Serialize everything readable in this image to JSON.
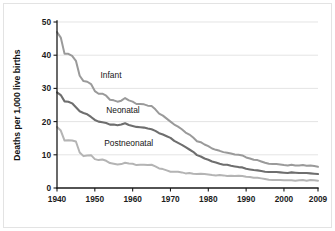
{
  "chart_data": {
    "type": "line",
    "title": "",
    "xlabel": "",
    "ylabel": "Deaths per 1,000 live births",
    "xlim": [
      1940,
      2009
    ],
    "ylim": [
      0,
      50
    ],
    "grid": true,
    "legend_position": "inline-labels",
    "xticks": [
      1940,
      1950,
      1960,
      1970,
      1980,
      1990,
      2000,
      2009
    ],
    "xtick_labels": [
      "1940",
      "1950",
      "1960",
      "1970",
      "1980",
      "1990",
      "2000",
      "2009"
    ],
    "yticks": [
      0,
      10,
      20,
      30,
      40,
      50
    ],
    "ytick_labels": [
      "0",
      "10",
      "20",
      "30",
      "40",
      "50"
    ],
    "x": [
      1940,
      1941,
      1942,
      1943,
      1944,
      1945,
      1946,
      1947,
      1948,
      1949,
      1950,
      1951,
      1952,
      1953,
      1954,
      1955,
      1956,
      1957,
      1958,
      1959,
      1960,
      1961,
      1962,
      1963,
      1964,
      1965,
      1966,
      1967,
      1968,
      1969,
      1970,
      1971,
      1972,
      1973,
      1974,
      1975,
      1976,
      1977,
      1978,
      1979,
      1980,
      1981,
      1982,
      1983,
      1984,
      1985,
      1986,
      1987,
      1988,
      1989,
      1990,
      1991,
      1992,
      1993,
      1994,
      1995,
      1996,
      1997,
      1998,
      1999,
      2000,
      2001,
      2002,
      2003,
      2004,
      2005,
      2006,
      2007,
      2008,
      2009
    ],
    "series": [
      {
        "name": "Infant",
        "color": "#9a9a9a",
        "label_x": 1951.5,
        "label_y": 33.2,
        "values": [
          47.0,
          45.3,
          40.4,
          40.4,
          39.8,
          38.3,
          33.8,
          32.2,
          32.0,
          31.3,
          29.2,
          28.4,
          28.4,
          27.8,
          26.6,
          26.4,
          26.0,
          26.3,
          27.1,
          26.4,
          26.0,
          25.3,
          25.3,
          25.2,
          24.8,
          24.7,
          23.7,
          22.4,
          21.8,
          20.9,
          20.0,
          19.1,
          18.5,
          17.7,
          16.7,
          16.1,
          15.2,
          14.1,
          13.8,
          13.1,
          12.6,
          11.9,
          11.5,
          11.2,
          10.8,
          10.6,
          10.4,
          10.1,
          10.0,
          9.8,
          9.2,
          8.9,
          8.5,
          8.4,
          8.0,
          7.6,
          7.3,
          7.2,
          7.2,
          7.1,
          6.9,
          6.8,
          7.0,
          6.8,
          6.8,
          6.9,
          6.7,
          6.8,
          6.6,
          6.4
        ]
      },
      {
        "name": "Neonatal",
        "color": "#6e6e6e",
        "label_x": 1953.0,
        "label_y": 22.6,
        "values": [
          28.8,
          28.0,
          26.1,
          26.0,
          25.5,
          24.3,
          23.1,
          22.6,
          22.2,
          21.4,
          20.5,
          20.0,
          19.8,
          19.6,
          19.1,
          19.1,
          18.9,
          19.1,
          19.5,
          19.0,
          18.7,
          18.4,
          18.3,
          18.2,
          17.9,
          17.7,
          17.2,
          16.5,
          16.1,
          15.6,
          15.1,
          14.2,
          13.6,
          13.0,
          12.3,
          11.6,
          10.9,
          9.9,
          9.5,
          8.9,
          8.5,
          8.0,
          7.7,
          7.3,
          7.0,
          7.0,
          6.7,
          6.5,
          6.3,
          6.2,
          5.8,
          5.6,
          5.4,
          5.3,
          5.1,
          4.9,
          4.8,
          4.8,
          4.8,
          4.7,
          4.6,
          4.5,
          4.7,
          4.6,
          4.5,
          4.5,
          4.5,
          4.4,
          4.3,
          4.2
        ]
      },
      {
        "name": "Postneonatal",
        "color": "#b4b4b4",
        "label_x": 1952.5,
        "label_y": 12.6,
        "values": [
          18.4,
          17.3,
          14.3,
          14.4,
          14.3,
          14.0,
          10.7,
          9.6,
          9.8,
          9.9,
          8.7,
          8.4,
          8.6,
          8.2,
          7.5,
          7.3,
          7.1,
          7.2,
          7.6,
          7.4,
          7.3,
          6.9,
          7.0,
          7.0,
          6.9,
          7.0,
          6.5,
          5.9,
          5.7,
          5.3,
          4.9,
          4.9,
          4.9,
          4.7,
          4.4,
          4.5,
          4.3,
          4.2,
          4.3,
          4.2,
          4.1,
          3.9,
          3.8,
          3.9,
          3.8,
          3.6,
          3.7,
          3.6,
          3.7,
          3.6,
          3.4,
          3.3,
          3.1,
          3.1,
          2.9,
          2.7,
          2.5,
          2.4,
          2.4,
          2.4,
          2.3,
          2.3,
          2.3,
          2.2,
          2.3,
          2.4,
          2.2,
          2.4,
          2.3,
          2.2
        ]
      }
    ]
  },
  "accessibility": {
    "figure_name": "infant-mortality-line-chart"
  }
}
